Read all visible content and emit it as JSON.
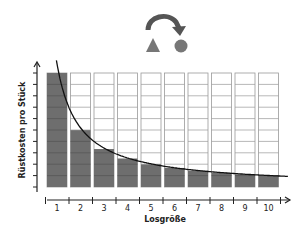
{
  "chart_data": {
    "type": "bar",
    "title": "",
    "xlabel": "Losgröße",
    "ylabel": "Rüstkosten pro Stück",
    "categories": [
      "1",
      "2",
      "3",
      "4",
      "5",
      "6",
      "7",
      "8",
      "9",
      "10"
    ],
    "values": [
      10,
      5,
      3.33,
      2.5,
      2,
      1.67,
      1.43,
      1.25,
      1.11,
      1
    ],
    "total_cells_per_column": 10,
    "ylim": [
      0,
      10
    ],
    "curve": {
      "type": "line",
      "formula": "y = 10 / x",
      "label": ""
    },
    "grid": true,
    "legend": "none",
    "colors": {
      "filled": "#6e6e6e",
      "empty": "#ffffff",
      "grid_line": "#9a9a9a",
      "curve": "#111111",
      "axis": "#222222"
    }
  },
  "header_icon": {
    "name": "swap-shapes-icon",
    "description": "curved arrow from triangle to circle"
  }
}
